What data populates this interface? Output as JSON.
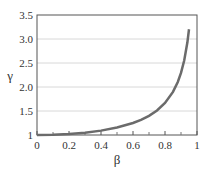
{
  "chart_data": {
    "type": "line",
    "title": "",
    "xlabel": "β",
    "ylabel": "γ",
    "xlim": [
      0,
      1
    ],
    "ylim": [
      1,
      3.5
    ],
    "grid": "horizontal",
    "legend": null,
    "x_ticks": [
      "0",
      "0.2",
      "0.4",
      "0.6",
      "0.8",
      "1"
    ],
    "y_ticks": [
      "1",
      "1.5",
      "2.0",
      "2.5",
      "3.0",
      "3.5"
    ],
    "series": [
      {
        "name": "γ = 1/√(1−β²)",
        "color": "#6b6b6b",
        "x": [
          0,
          0.1,
          0.2,
          0.3,
          0.4,
          0.5,
          0.6,
          0.65,
          0.7,
          0.75,
          0.8,
          0.85,
          0.88,
          0.9,
          0.92,
          0.94,
          0.95
        ],
        "y": [
          1.0,
          1.005,
          1.021,
          1.048,
          1.091,
          1.155,
          1.25,
          1.316,
          1.4,
          1.512,
          1.667,
          1.898,
          2.105,
          2.294,
          2.552,
          2.931,
          3.203
        ]
      }
    ]
  }
}
